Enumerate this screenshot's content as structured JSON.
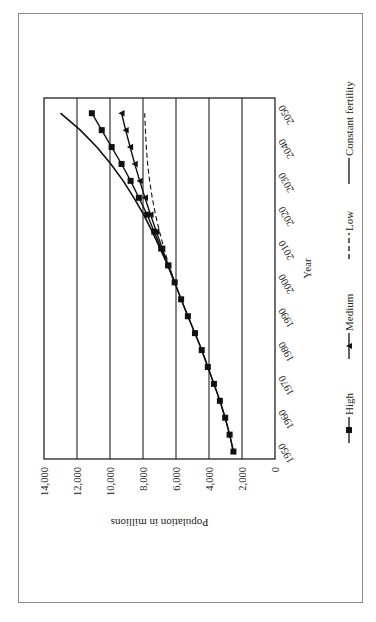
{
  "chart_data": {
    "type": "line",
    "title": "",
    "orientation": "rotated 90 degrees clockwise (page printed sideways)",
    "xlabel": "Year",
    "ylabel": "Population in millions",
    "x_ticks": [
      "1950",
      "1960",
      "1970",
      "1980",
      "1990",
      "2000",
      "2010",
      "2020",
      "2030",
      "2040",
      "2050"
    ],
    "y_ticks": [
      "0",
      "2,000",
      "4,000",
      "6,000",
      "8,000",
      "10,000",
      "12,000",
      "14,000"
    ],
    "ylim": [
      0,
      14000
    ],
    "xlim": [
      1950,
      2053
    ],
    "grid": "horizontal gridlines at each y tick",
    "legend_position": "bottom",
    "x": [
      1950,
      1955,
      1960,
      1965,
      1970,
      1975,
      1980,
      1985,
      1990,
      1995,
      2000,
      2005,
      2010,
      2015,
      2020,
      2025,
      2030,
      2035,
      2040,
      2045,
      2050
    ],
    "series": [
      {
        "name": "High",
        "marker": "square",
        "line": "solid",
        "values": [
          2520,
          2750,
          3020,
          3340,
          3700,
          4070,
          4440,
          4850,
          5280,
          5690,
          6080,
          6480,
          6900,
          7320,
          7750,
          8250,
          8750,
          9300,
          9900,
          10500,
          11100
        ]
      },
      {
        "name": "Medium",
        "marker": "triangle",
        "line": "solid",
        "values": [
          2520,
          2750,
          3020,
          3340,
          3700,
          4070,
          4440,
          4850,
          5280,
          5690,
          6080,
          6460,
          6830,
          7190,
          7540,
          7880,
          8200,
          8500,
          8780,
          9050,
          9300
        ]
      },
      {
        "name": "Low",
        "marker": "none",
        "line": "dashed",
        "values": [
          null,
          null,
          null,
          null,
          null,
          null,
          null,
          null,
          null,
          null,
          6080,
          6420,
          6730,
          7000,
          7240,
          7440,
          7600,
          7720,
          7800,
          7850,
          7900
        ]
      },
      {
        "name": "Constant fertility",
        "marker": "none",
        "line": "solid",
        "values": [
          null,
          null,
          null,
          null,
          null,
          null,
          null,
          null,
          null,
          null,
          6080,
          6500,
          6960,
          7440,
          7960,
          8550,
          9200,
          9950,
          10800,
          11800,
          13000
        ]
      }
    ]
  },
  "legend": {
    "items": [
      {
        "label": "High",
        "marker": "square"
      },
      {
        "label": "Medium",
        "marker": "triangle"
      },
      {
        "label": "Low",
        "marker": "dashed"
      },
      {
        "label": "Constant fertility",
        "marker": "solid"
      }
    ]
  },
  "axes": {
    "xlabel": "Year",
    "ylabel": "Population in millions",
    "x_ticks": [
      "1950",
      "1960",
      "1970",
      "1980",
      "1990",
      "2000",
      "2010",
      "2020",
      "2030",
      "2040",
      "2050"
    ],
    "y_ticks": [
      "0",
      "2,000",
      "4,000",
      "6,000",
      "8,000",
      "10,000",
      "12,000",
      "14,000"
    ]
  },
  "colors": {
    "line": "#111111",
    "grid": "#222222",
    "border": "#8a8a8a",
    "background": "#ffffff"
  }
}
